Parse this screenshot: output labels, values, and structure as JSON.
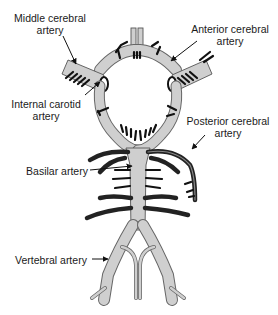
{
  "diagram": {
    "colors": {
      "vessel_fill": "#cfcfcf",
      "vessel_outline": "#555555",
      "branch": "#111111",
      "text": "#1a1a1a",
      "background": "#ffffff"
    },
    "labels": {
      "middle_cerebral": {
        "line1": "Middle cerebral",
        "line2": "artery"
      },
      "anterior_cerebral": {
        "line1": "Anterior cerebral",
        "line2": "artery"
      },
      "internal_carotid": {
        "line1": "Internal carotid",
        "line2": "artery"
      },
      "posterior_cerebral": {
        "line1": "Posterior cerebral",
        "line2": "artery"
      },
      "basilar": {
        "line1": "Basilar artery"
      },
      "vertebral": {
        "line1": "Vertebral artery"
      }
    }
  }
}
